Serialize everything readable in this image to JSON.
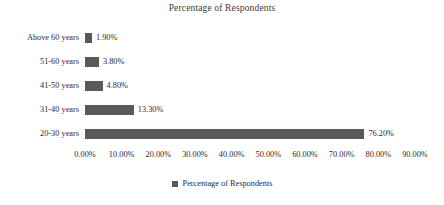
{
  "chart_data": {
    "type": "bar",
    "orientation": "horizontal",
    "title": "Percentage of Respondents",
    "xlabel": "",
    "ylabel": "",
    "categories": [
      "Above 60 years",
      "51-60 years",
      "41-50 years",
      "31-40 years",
      "20-30 years"
    ],
    "values": [
      1.9,
      3.8,
      4.8,
      13.3,
      76.2
    ],
    "value_labels": [
      "1.90%",
      "3.80%",
      "4.80%",
      "13.30%",
      "76.20%"
    ],
    "series": [
      {
        "name": "Percentage of Respondents",
        "values": [
          1.9,
          3.8,
          4.8,
          13.3,
          76.2
        ]
      }
    ],
    "xlim": [
      0,
      90
    ],
    "x_tick_values": [
      0,
      10,
      20,
      30,
      40,
      50,
      60,
      70,
      80,
      90
    ],
    "x_tick_labels": [
      "0.00%",
      "10.00%",
      "20.00%",
      "30.00%",
      "40.00%",
      "50.00%",
      "60.00%",
      "70.00%",
      "80.00%",
      "90.00%"
    ],
    "grid": false,
    "legend_position": "bottom",
    "legend_entries": [
      "Percentage of Respondents"
    ],
    "bar_color": "#595959",
    "background_color": "#ffffff",
    "text_color": "#2b2b2b"
  },
  "legend": {
    "marker_name": "legend-square-marker",
    "label": "Percentage of Respondents"
  }
}
